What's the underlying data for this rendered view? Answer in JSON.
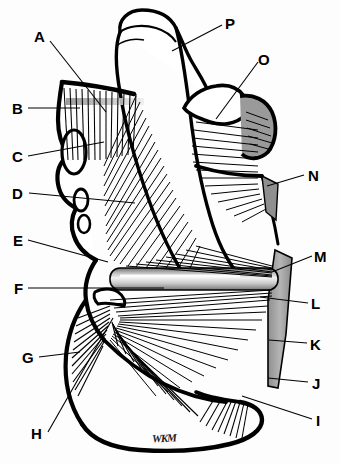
{
  "figure": {
    "signature": "WKM",
    "background_color": "#ffffff",
    "ink_color": "#000000",
    "bone_fill_color": "#ffffff",
    "cartilage_gray": "#9a9a9a",
    "shaft_gray": "#b9b9b9",
    "width": 340,
    "height": 464
  },
  "labels": {
    "left": [
      {
        "id": "label-a",
        "text": "A",
        "x": 34,
        "y": 29,
        "leader": {
          "x1": 50,
          "y1": 41,
          "x2": 106,
          "y2": 112
        }
      },
      {
        "id": "label-b",
        "text": "B",
        "x": 12,
        "y": 101,
        "leader": {
          "x1": 28,
          "y1": 108,
          "x2": 80,
          "y2": 108
        }
      },
      {
        "id": "label-c",
        "text": "C",
        "x": 12,
        "y": 149,
        "leader": {
          "x1": 28,
          "y1": 156,
          "x2": 104,
          "y2": 142
        }
      },
      {
        "id": "label-d",
        "text": "D",
        "x": 12,
        "y": 186,
        "leader": {
          "x1": 29,
          "y1": 193,
          "x2": 135,
          "y2": 203
        }
      },
      {
        "id": "label-e",
        "text": "E",
        "x": 13,
        "y": 233,
        "leader": {
          "x1": 28,
          "y1": 240,
          "x2": 108,
          "y2": 262
        }
      },
      {
        "id": "label-f",
        "text": "F",
        "x": 14,
        "y": 281,
        "leader": {
          "x1": 28,
          "y1": 288,
          "x2": 164,
          "y2": 288
        }
      },
      {
        "id": "label-g",
        "text": "G",
        "x": 22,
        "y": 350,
        "leader": {
          "x1": 39,
          "y1": 357,
          "x2": 80,
          "y2": 352
        }
      },
      {
        "id": "label-h",
        "text": "H",
        "x": 31,
        "y": 426,
        "leader": {
          "x1": 48,
          "y1": 432,
          "x2": 113,
          "y2": 318
        }
      }
    ],
    "right": [
      {
        "id": "label-p",
        "text": "P",
        "x": 225,
        "y": 16,
        "leader": {
          "x1": 222,
          "y1": 25,
          "x2": 172,
          "y2": 51
        }
      },
      {
        "id": "label-o",
        "text": "O",
        "x": 258,
        "y": 52,
        "leader": {
          "x1": 258,
          "y1": 62,
          "x2": 216,
          "y2": 119
        }
      },
      {
        "id": "label-n",
        "text": "N",
        "x": 308,
        "y": 168,
        "leader": {
          "x1": 304,
          "y1": 175,
          "x2": 267,
          "y2": 186
        }
      },
      {
        "id": "label-m",
        "text": "M",
        "x": 314,
        "y": 249,
        "leader": {
          "x1": 312,
          "y1": 256,
          "x2": 272,
          "y2": 272
        }
      },
      {
        "id": "label-l",
        "text": "L",
        "x": 311,
        "y": 296,
        "leader": {
          "x1": 308,
          "y1": 303,
          "x2": 260,
          "y2": 297
        }
      },
      {
        "id": "label-k",
        "text": "K",
        "x": 310,
        "y": 337,
        "leader": {
          "x1": 307,
          "y1": 343,
          "x2": 269,
          "y2": 340
        }
      },
      {
        "id": "label-j",
        "text": "J",
        "x": 312,
        "y": 376,
        "leader": {
          "x1": 308,
          "y1": 382,
          "x2": 268,
          "y2": 378
        }
      },
      {
        "id": "label-i",
        "text": "I",
        "x": 316,
        "y": 413,
        "leader": {
          "x1": 312,
          "y1": 419,
          "x2": 242,
          "y2": 396
        }
      }
    ]
  }
}
